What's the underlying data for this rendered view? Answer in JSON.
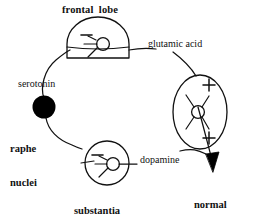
{
  "diagram": {
    "stroke_color": "#111111",
    "fill_color": "#000000",
    "background_color": "#ffffff",
    "structures": [
      {
        "id": "frontal-lobe",
        "label": "frontal  lobe",
        "shape": "dome-with-base",
        "sign": "minus",
        "bold": true
      },
      {
        "id": "raphe-nuclei",
        "label": "raphe\nnuclei",
        "shape": "filled-circle",
        "sign": "",
        "bold": true
      },
      {
        "id": "substantia-nigra",
        "label": "substantia\nnigra",
        "shape": "circle",
        "sign": "minus",
        "bold": true
      },
      {
        "id": "striatum",
        "label": "",
        "shape": "ellipse",
        "sign": "plus-plus",
        "bold": false
      }
    ],
    "pathways": [
      {
        "id": "serotonin",
        "label": "serotonin",
        "from": "raphe-nuclei",
        "to": "frontal-lobe",
        "bold": false
      },
      {
        "id": "glutamic-acid",
        "label": "glutamic acid",
        "from": "frontal-lobe",
        "to": "striatum",
        "bold": false
      },
      {
        "id": "dopamine",
        "label": "dopamine",
        "from": "substantia-nigra",
        "to": "striatum",
        "bold": false
      }
    ],
    "outcome": {
      "id": "normal-motor-functions",
      "label": "normal\nmotor\nfunctions",
      "bold": true,
      "arrow": "down-right"
    },
    "signs": {
      "minus": "−",
      "plus": "+"
    }
  },
  "labels": {
    "frontal_lobe": "frontal  lobe",
    "glutamic_acid": "glutamic acid",
    "serotonin": "serotonin",
    "raphe_nuclei_line1": "raphe",
    "raphe_nuclei_line2": "nuclei",
    "dopamine": "dopamine",
    "substantia_nigra_line1": "substantia",
    "substantia_nigra_line2": "nigra",
    "normal_line1": "normal",
    "normal_line2": "motor",
    "normal_line3": "functions"
  }
}
